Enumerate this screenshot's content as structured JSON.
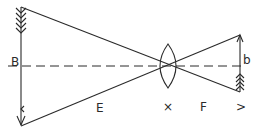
{
  "diagram": {
    "type": "lens-image-formation",
    "colors": {
      "stroke": "#2a2a2a",
      "background": "#ffffff"
    },
    "labels": {
      "object": "B",
      "object_distance": "E",
      "lens_center_mark": "×",
      "image_distance": "F",
      "image_end_mark": ">",
      "image": "b"
    },
    "elements": {
      "object_arrow": {
        "x": 21,
        "top": 7,
        "bottom": 126,
        "direction": "down"
      },
      "image_arrow": {
        "x": 240,
        "top": 35,
        "bottom": 92,
        "direction": "up"
      },
      "lens": {
        "cx": 168,
        "cy": 66,
        "half_height": 22,
        "half_width": 8
      },
      "optical_axis": {
        "y": 66,
        "x_start": 8,
        "x_end": 245,
        "style": "dashed"
      },
      "rays": [
        {
          "from": [
            21,
            7
          ],
          "to": [
            240,
            92
          ]
        },
        {
          "from": [
            21,
            126
          ],
          "to": [
            240,
            35
          ]
        }
      ]
    }
  }
}
